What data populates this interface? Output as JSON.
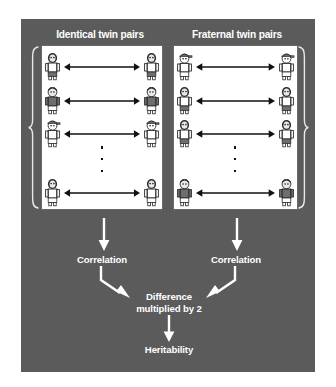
{
  "figure": {
    "name": "twin-study-heritability-diagram",
    "background_color": "#5b5b5b",
    "panel_color": "#ffffff",
    "text_color": "#ffffff",
    "headings": {
      "left": "Identical twin pairs",
      "right": "Fraternal twin pairs"
    },
    "groups": [
      {
        "id": "identical",
        "heading": "Identical twin pairs",
        "brace": "left-curly-brace",
        "rows": [
          {
            "left_person": "long-hair-white-shirt",
            "right_person": "long-hair-white-shirt",
            "connector": "double-headed-arrow"
          },
          {
            "left_person": "short-hair-dark-shirt",
            "right_person": "short-hair-dark-shirt",
            "connector": "double-headed-arrow"
          },
          {
            "left_person": "cap-white-shirt",
            "right_person": "cap-white-shirt",
            "connector": "double-headed-arrow"
          },
          {
            "left_person": "long-hair-white-shirt",
            "right_person": "long-hair-white-shirt",
            "connector": "double-headed-arrow"
          }
        ],
        "ellipsis": "vertical-dots",
        "result_label": "Correlation"
      },
      {
        "id": "fraternal",
        "heading": "Fraternal twin pairs",
        "brace": "right-curly-brace",
        "rows": [
          {
            "left_person": "cap-white-shirt",
            "right_person": "cap-white-shirt",
            "connector": "double-headed-arrow"
          },
          {
            "left_person": "long-hair-white-shirt",
            "right_person": "long-hair-white-shirt",
            "connector": "double-headed-arrow"
          },
          {
            "left_person": "long-hair-white-shirt",
            "right_person": "long-hair-white-shirt",
            "connector": "double-headed-arrow"
          },
          {
            "left_person": "short-hair-dark-shirt",
            "right_person": "short-hair-dark-shirt",
            "connector": "double-headed-arrow"
          }
        ],
        "ellipsis": "vertical-dots",
        "result_label": "Correlation"
      }
    ],
    "flow": {
      "correlation_left": "Correlation",
      "correlation_right": "Correlation",
      "difference": "Difference\nmultiplied by 2",
      "difference_line1": "Difference",
      "difference_line2": "multiplied by 2",
      "heritability": "Heritability"
    }
  }
}
